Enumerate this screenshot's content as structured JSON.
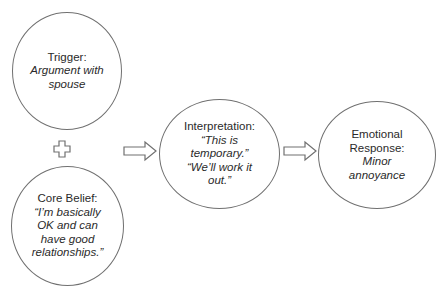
{
  "diagram": {
    "nodes": [
      {
        "id": "trigger",
        "label": "Trigger:",
        "text": "Argument with\nspouse"
      },
      {
        "id": "core_belief",
        "label": "Core Belief:",
        "text": "“I’m basically\nOK and can\nhave good\nrelationships.”"
      },
      {
        "id": "interpretation",
        "label": "Interpretation:",
        "text": "“This is\ntemporary.”\n“We’ll work it\nout.”"
      },
      {
        "id": "emotional_response",
        "label": "Emotional\nResponse:",
        "text": "Minor\nannoyance"
      }
    ],
    "connectors": [
      {
        "type": "plus",
        "from": "trigger",
        "to": "core_belief"
      },
      {
        "type": "arrow",
        "from": "trigger+core_belief",
        "to": "interpretation"
      },
      {
        "type": "arrow",
        "from": "interpretation",
        "to": "emotional_response"
      }
    ],
    "colors": {
      "stroke": "#707070",
      "text": "#2a2a2a",
      "background": "#ffffff"
    }
  }
}
